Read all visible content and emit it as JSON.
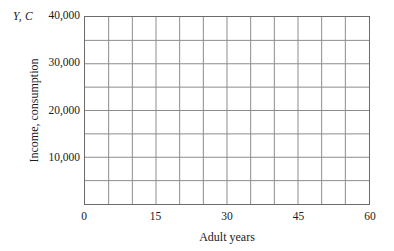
{
  "chart_data": {
    "type": "line",
    "title": "",
    "subtitle": "",
    "corner_label": "Y, C",
    "xlabel": "Adult years",
    "ylabel": "Income, consumption",
    "xlim": [
      0,
      60
    ],
    "ylim": [
      0,
      40000
    ],
    "xticks": [
      {
        "value": 0,
        "label": "0"
      },
      {
        "value": 15,
        "label": "15"
      },
      {
        "value": 30,
        "label": "30"
      },
      {
        "value": 45,
        "label": "45"
      },
      {
        "value": 60,
        "label": "60"
      }
    ],
    "yticks": [
      {
        "value": 10000,
        "label": "10,000"
      },
      {
        "value": 20000,
        "label": "20,000"
      },
      {
        "value": 30000,
        "label": "30,000"
      },
      {
        "value": 40000,
        "label": "40,000"
      }
    ],
    "grid": {
      "enabled": true,
      "x_step": 5,
      "y_step": 5000,
      "color": "#8c8c8c"
    },
    "frame_color": "#6b6b6b",
    "background_color": "#ffffff",
    "legend": null,
    "series": [],
    "annotations": [],
    "note": "Empty grid; no data series plotted."
  }
}
